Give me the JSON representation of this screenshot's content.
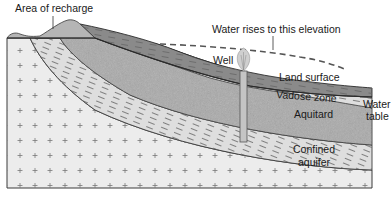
{
  "diagram": {
    "labels": {
      "recharge": "Area of recharge",
      "water_rises": "Water rises to this elevation",
      "well": "Well",
      "land_surface": "Land surface",
      "vadose_zone": "Vadose zone",
      "water_table_line1": "Water",
      "water_table_line2": "table",
      "aquitard": "Aquitard",
      "confined_line1": "Confined",
      "confined_line2": "aquifer"
    },
    "colors": {
      "bedrock": "#ececec",
      "aquitard": "#dedede",
      "aquifer": "#a9a9a9",
      "vadose": "#8a8a8a",
      "hill": "#b5b5b5",
      "outline": "#3a3a3a",
      "text": "#1a1a1a"
    }
  }
}
